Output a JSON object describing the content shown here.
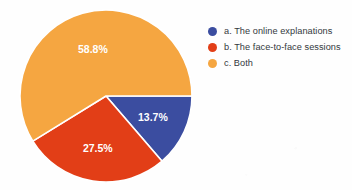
{
  "chart_data": {
    "type": "pie",
    "title": "",
    "categories": [
      "a. The online explanations",
      "b. The face-to-face sessions",
      "c. Both"
    ],
    "values": [
      13.7,
      27.5,
      58.8
    ],
    "value_labels": [
      "13.7%",
      "27.5%",
      "58.8%"
    ],
    "colors": [
      "#3b4da0",
      "#e23e17",
      "#f5a641"
    ],
    "legend_position": "right",
    "grid": false,
    "start_angle_deg": 0,
    "direction": "clockwise",
    "slices": [
      {
        "key": "a",
        "label": "a. The online explanations",
        "legend_label": "a. The online explanations",
        "value": 13.7,
        "value_label": "13.7%",
        "color": "#3b4da0"
      },
      {
        "key": "b",
        "label": "b. The face-to-face sessions",
        "legend_label": "b. The face-to-face sessions",
        "value": 27.5,
        "value_label": "27.5%",
        "color": "#e23e17"
      },
      {
        "key": "c",
        "label": "c. Both",
        "legend_label": "c. Both",
        "value": 58.8,
        "value_label": "58.8%",
        "color": "#f5a641"
      }
    ]
  },
  "legend": {
    "items": [
      {
        "label": "a. The online explanations",
        "color": "#3b4da0"
      },
      {
        "label": "b. The face-to-face sessions",
        "color": "#e23e17"
      },
      {
        "label": "c. Both",
        "color": "#f5a641"
      }
    ]
  },
  "labels": {
    "blue": "13.7%",
    "red": "27.5%",
    "orange": "58.8%"
  },
  "geometry": {
    "center_x": 106,
    "center_y": 96,
    "radius": 86
  },
  "style": {
    "background": "#fefefe",
    "label_color": "#ffffff",
    "legend_text_color": "#33383d",
    "separator_color": "#ffffff"
  }
}
